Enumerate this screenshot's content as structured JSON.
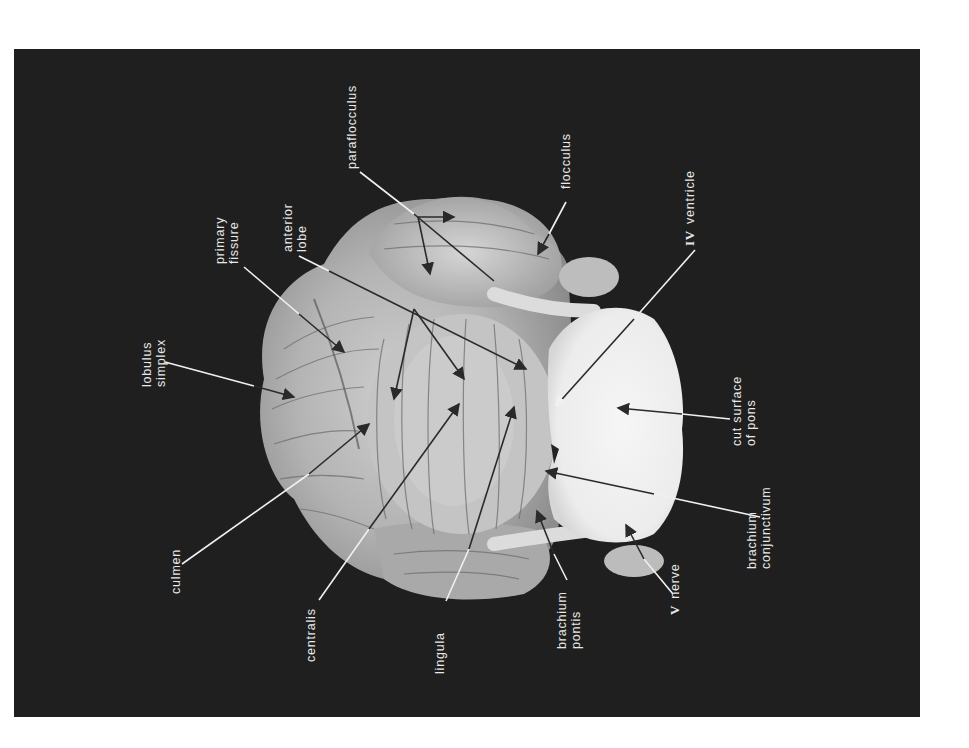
{
  "figure": {
    "background_color": "#1f1f1f",
    "page_color": "#ffffff",
    "label_color": "#e8e8e8",
    "text_orientation": "rotated 90 degrees counter-clockwise"
  },
  "labels": {
    "lobulus_simplex": {
      "line1": "lobulus",
      "line2": "simplex"
    },
    "primary_fissure": {
      "line1": "primary",
      "line2": "fissure"
    },
    "anterior_lobe": {
      "line1": "anterior",
      "line2": "lobe"
    },
    "paraflocculus": {
      "line1": "paraflocculus"
    },
    "flocculus": {
      "line1": "flocculus"
    },
    "ventricle": {
      "numeral": "IV",
      "line1": "ventricle"
    },
    "cut_surface_pons": {
      "line1": "cut surface",
      "line2": "of pons"
    },
    "brachium_conjunctivum": {
      "line1": "brachium",
      "line2": "conjunctivum"
    },
    "nerve": {
      "numeral": "V",
      "line1": "nerve"
    },
    "brachium_pontis": {
      "line1": "brachium",
      "line2": "pontis"
    },
    "lingula": {
      "line1": "lingula"
    },
    "centralis": {
      "line1": "centralis"
    },
    "culmen": {
      "line1": "culmen"
    }
  }
}
